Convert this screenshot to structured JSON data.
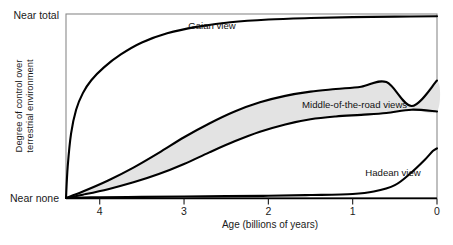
{
  "chart_data": {
    "type": "line",
    "title": "",
    "xlabel": "Age (billions of years)",
    "ylabel_line1": "Degree of control over",
    "ylabel_line2": "terrestrial environment",
    "xlim": [
      4.4,
      0
    ],
    "ylim": [
      0,
      1
    ],
    "x_ticks": [
      4,
      3,
      2,
      1,
      0
    ],
    "x_tick_labels": [
      "4",
      "3",
      "2",
      "1",
      "0"
    ],
    "y_tick_labels": [
      "Near total",
      "Near none"
    ],
    "y_tick_top": "Near total",
    "y_tick_bottom": "Near none",
    "grid": false,
    "legend": "none",
    "annotations": [
      {
        "text": "Gaian view",
        "x": 2.95,
        "y": 0.92
      },
      {
        "text": "Middle-of-the-road views",
        "x": 1.6,
        "y": 0.49
      },
      {
        "text": "Hadean view",
        "x": 0.85,
        "y": 0.12
      }
    ],
    "series": [
      {
        "name": "Gaian view",
        "style": "solid",
        "x": [
          4.4,
          4.38,
          4.34,
          4.28,
          4.2,
          4.1,
          3.95,
          3.75,
          3.5,
          3.2,
          2.85,
          2.45,
          2.0,
          1.5,
          1.0,
          0.5,
          0.0
        ],
        "y": [
          0.0,
          0.17,
          0.35,
          0.48,
          0.57,
          0.64,
          0.71,
          0.78,
          0.845,
          0.895,
          0.93,
          0.955,
          0.97,
          0.978,
          0.983,
          0.986,
          0.988
        ]
      },
      {
        "name": "Middle-of-the-road upper bound",
        "style": "solid",
        "x": [
          4.4,
          4.2,
          3.9,
          3.6,
          3.3,
          3.0,
          2.7,
          2.4,
          2.1,
          1.8,
          1.5,
          1.2,
          0.9,
          0.6,
          0.3,
          0.0
        ],
        "y": [
          0.0,
          0.035,
          0.095,
          0.165,
          0.245,
          0.33,
          0.405,
          0.47,
          0.52,
          0.555,
          0.578,
          0.592,
          0.605,
          0.63,
          0.5,
          0.638
        ]
      },
      {
        "name": "Middle-of-the-road lower bound",
        "style": "solid",
        "x": [
          4.4,
          4.2,
          3.9,
          3.6,
          3.3,
          3.0,
          2.7,
          2.4,
          2.1,
          1.8,
          1.5,
          1.2,
          0.9,
          0.6,
          0.3,
          0.0
        ],
        "y": [
          0.0,
          0.018,
          0.048,
          0.085,
          0.13,
          0.185,
          0.248,
          0.308,
          0.36,
          0.4,
          0.428,
          0.443,
          0.452,
          0.462,
          0.48,
          0.47
        ]
      },
      {
        "name": "Hadean view",
        "style": "solid",
        "x": [
          4.4,
          4.0,
          3.5,
          3.0,
          2.5,
          2.0,
          1.5,
          1.0,
          0.75,
          0.5,
          0.3,
          0.15,
          0.05,
          0.0
        ],
        "y": [
          0.0,
          0.004,
          0.006,
          0.008,
          0.01,
          0.012,
          0.016,
          0.022,
          0.035,
          0.07,
          0.14,
          0.205,
          0.255,
          0.27
        ]
      }
    ],
    "band_fill_color": "#e2e2e2",
    "line_color": "#000000",
    "frame_color": "#808080",
    "background_color": "#ffffff"
  }
}
